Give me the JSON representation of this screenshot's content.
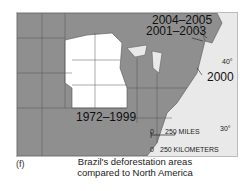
{
  "map": {
    "labels": {
      "l2004": "2004–2005",
      "l2001": "2001–2003",
      "l2000": "2000",
      "l1972": "1972–1999"
    },
    "latitudes": {
      "lat40": "40°",
      "lat30": "30°"
    },
    "scale": {
      "zero_miles": "0",
      "miles": "250 MILES",
      "zero_km": "0",
      "km": "250 KILOMETERS"
    },
    "colors": {
      "states": "#8f8f8f",
      "deforested": "#ffffff",
      "ocean": "#e9e9e9"
    }
  },
  "figure": {
    "label": "(f)",
    "caption": "Brazil's deforestation areas compared to North America"
  }
}
